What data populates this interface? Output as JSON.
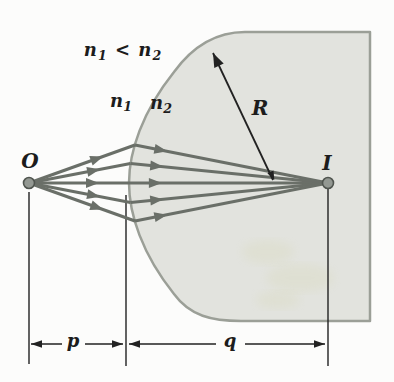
{
  "figure": {
    "relation": {
      "lhs_base": "n",
      "lhs_sub": "1",
      "operator": "<",
      "rhs_base": "n",
      "rhs_sub": "2"
    },
    "medium1_label": {
      "base": "n",
      "sub": "1"
    },
    "medium2_label": {
      "base": "n",
      "sub": "2"
    },
    "radius_label": "R",
    "object_label": "O",
    "image_label": "I",
    "object_distance_label": "p",
    "image_distance_label": "q"
  },
  "colors": {
    "background": "#fcfcfb",
    "medium_fill": "#e2e3de",
    "medium_border": "#9b9f97",
    "ray": "#6a6f68",
    "dark_line": "#222222",
    "dot_fill": "#939892",
    "dot_stroke": "#50554f",
    "text": "#1c1c1c",
    "artifact": "#cfcf9a"
  },
  "geometry": {
    "canvas": {
      "width": 394,
      "height": 382
    },
    "medium_path": "M 245,32 L 370,32 L 370,321 L 241,321 C 212,321 190,316 174,294 C 142,254 129,214 129,183 C 129,152 142,112 174,72 C 190,50 212,32 245,32 Z",
    "object_point": {
      "x": 29,
      "y": 183,
      "r": 5.5
    },
    "image_point": {
      "x": 328,
      "y": 183,
      "r": 5.5
    },
    "rays": [
      {
        "hit": {
          "x": 135,
          "y": 145
        }
      },
      {
        "hit": {
          "x": 130.5,
          "y": 163.5
        }
      },
      {
        "hit": {
          "x": 129,
          "y": 183
        }
      },
      {
        "hit": {
          "x": 130.5,
          "y": 202.5
        }
      },
      {
        "hit": {
          "x": 135,
          "y": 221
        }
      }
    ],
    "ray_width": 3.2,
    "incident_arrow_t": 0.7,
    "refracted_arrow_t": 0.1,
    "ray_arrow": {
      "len": 13,
      "halfw": 5
    },
    "radius_arrow": {
      "x1": 273,
      "y1": 180,
      "x2": 213,
      "y2": 53,
      "tip_head": {
        "len": 14,
        "halfw": 5.2
      },
      "tail_head": {
        "len": 9,
        "halfw": 3.4
      }
    },
    "guides": [
      {
        "x": 29,
        "y1": 192,
        "y2": 364
      },
      {
        "x": 126,
        "y1": 195,
        "y2": 366
      },
      {
        "x": 328,
        "y1": 189,
        "y2": 366
      }
    ],
    "dim_arrow": {
      "len": 11,
      "halfw": 3.8
    },
    "dim_p": {
      "tip_left": 31,
      "tip_right": 123,
      "y": 344,
      "gap_x1": 62,
      "gap_x2": 85
    },
    "dim_q": {
      "tip_left": 129,
      "tip_right": 325,
      "y": 344,
      "gap_x1": 216,
      "gap_x2": 245
    },
    "artifacts": [
      {
        "cx": 268,
        "cy": 252,
        "rx": 26,
        "ry": 12
      },
      {
        "cx": 300,
        "cy": 278,
        "rx": 34,
        "ry": 14
      },
      {
        "cx": 278,
        "cy": 300,
        "rx": 22,
        "ry": 9
      }
    ]
  }
}
